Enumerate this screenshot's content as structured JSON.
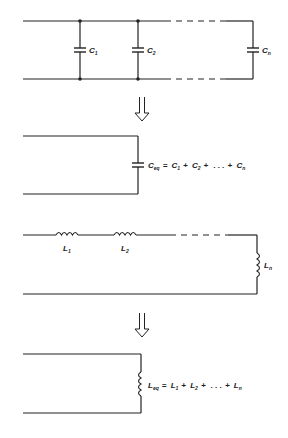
{
  "diagram": {
    "parallel_capacitors": {
      "labels": [
        {
          "main": "C",
          "sub": "1"
        },
        {
          "main": "C",
          "sub": "2"
        },
        {
          "main": "C",
          "sub": "n"
        }
      ]
    },
    "equivalent_capacitor": {
      "label_main": "C",
      "label_sub": "eq",
      "formula_rest": "= C",
      "terms": [
        {
          "main": "C",
          "sub": "1"
        },
        {
          "main": "C",
          "sub": "2"
        },
        {
          "main": "C",
          "sub": "n"
        }
      ],
      "formula_text": "C_eq = C1 + C2 + . . . + Cn"
    },
    "series_inductors": {
      "labels": [
        {
          "main": "L",
          "sub": "1"
        },
        {
          "main": "L",
          "sub": "2"
        },
        {
          "main": "L",
          "sub": "n"
        }
      ]
    },
    "equivalent_inductor": {
      "label_main": "L",
      "label_sub": "eq",
      "terms": [
        {
          "main": "L",
          "sub": "1"
        },
        {
          "main": "L",
          "sub": "2"
        },
        {
          "main": "L",
          "sub": "n"
        }
      ],
      "formula_text": "L_eq = L1 + L2 + . . . + Ln"
    },
    "symbols": {
      "equals": "=",
      "plus": "+",
      "ellipsis": ". . ."
    }
  }
}
